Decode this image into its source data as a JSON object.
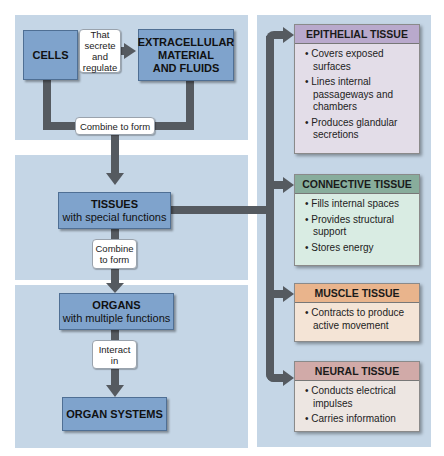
{
  "left": {
    "cells": {
      "title": "CELLS"
    },
    "secrete_label": {
      "lines": [
        "That",
        "secrete",
        "and",
        "regulate"
      ]
    },
    "extracellular": {
      "title_lines": [
        "EXTRACELLULAR",
        "MATERIAL",
        "AND FLUIDS"
      ]
    },
    "combine1": {
      "label": "Combine to form"
    },
    "tissues": {
      "title": "TISSUES",
      "subtitle": "with special functions"
    },
    "combine2": {
      "lines": [
        "Combine",
        "to form"
      ]
    },
    "organs": {
      "title": "ORGANS",
      "subtitle": "with multiple functions"
    },
    "interact": {
      "lines": [
        "Interact",
        "in"
      ]
    },
    "organ_systems": {
      "title": "ORGAN SYSTEMS"
    }
  },
  "right": {
    "tissue_types": [
      {
        "title": "EPITHELIAL TISSUE",
        "header_color": "#b9a9cc",
        "body_color": "#e3dde8",
        "bullets": [
          "Covers exposed surfaces",
          "Lines internal passageways and chambers",
          "Produces glandular secretions"
        ]
      },
      {
        "title": "CONNECTIVE TISSUE",
        "header_color": "#88ad9c",
        "body_color": "#d9ece3",
        "bullets": [
          "Fills internal spaces",
          "Provides structural support",
          "Stores energy"
        ]
      },
      {
        "title": "MUSCLE TISSUE",
        "header_color": "#e9b48c",
        "body_color": "#f4e4d6",
        "bullets": [
          "Contracts to produce active movement"
        ]
      },
      {
        "title": "NEURAL TISSUE",
        "header_color": "#d1aaa8",
        "body_color": "#ede6e2",
        "bullets": [
          "Conducts electrical impulses",
          "Carries information"
        ]
      }
    ]
  },
  "colors": {
    "panel": "#c5d6e6",
    "level_box": "#7fa3cc",
    "arrow": "#555a60"
  }
}
